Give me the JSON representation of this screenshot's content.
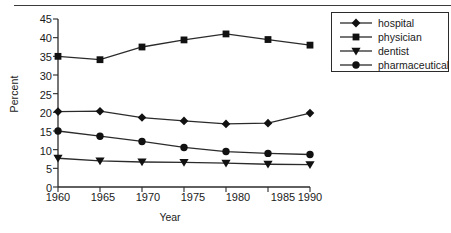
{
  "chart_data": {
    "type": "line",
    "title": "",
    "xlabel": "Year",
    "ylabel": "Percent",
    "x": [
      1960,
      1965,
      1970,
      1975,
      1980,
      1985,
      1990
    ],
    "xtick_labels": [
      "1960",
      "1965",
      "1970",
      "1975",
      "1980",
      "1985",
      "1990"
    ],
    "ytick_labels": [
      "0",
      "5",
      "10",
      "15",
      "20",
      "25",
      "30",
      "35",
      "40",
      "45"
    ],
    "ytick_values": [
      0,
      5,
      10,
      15,
      20,
      25,
      30,
      35,
      40,
      45
    ],
    "ylim": [
      0,
      45
    ],
    "xlim": [
      1960,
      1990
    ],
    "grid": false,
    "legend_position": "top-right",
    "series": [
      {
        "name": "hospital",
        "marker": "diamond",
        "values": [
          20.2,
          20.3,
          18.6,
          17.7,
          16.9,
          17.1,
          19.8
        ]
      },
      {
        "name": "physician",
        "marker": "square",
        "values": [
          35.0,
          34.1,
          37.5,
          39.4,
          41.0,
          39.5,
          38.0
        ]
      },
      {
        "name": "dentist",
        "marker": "triangle-down",
        "values": [
          7.7,
          7.0,
          6.7,
          6.6,
          6.4,
          6.1,
          6.0
        ]
      },
      {
        "name": "pharmaceutical",
        "marker": "circle",
        "values": [
          15.0,
          13.6,
          12.2,
          10.6,
          9.5,
          9.0,
          8.7
        ]
      }
    ]
  },
  "legend": {
    "items": [
      {
        "label": "hospital",
        "marker": "diamond"
      },
      {
        "label": "physician",
        "marker": "square"
      },
      {
        "label": "dentist",
        "marker": "triangle-down"
      },
      {
        "label": "pharmaceutical",
        "marker": "circle"
      }
    ]
  },
  "colors": {
    "line": "#2b2b2b",
    "marker": "#111111",
    "axis": "#2b2b2b",
    "text": "#1a1a1a",
    "background": "#ffffff"
  }
}
